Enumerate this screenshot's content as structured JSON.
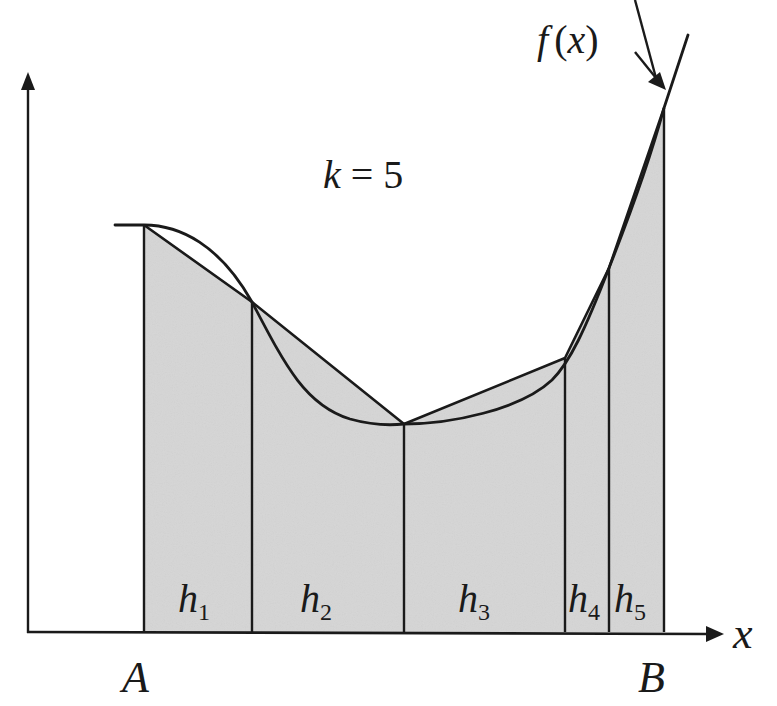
{
  "diagram": {
    "title_label": "k = 5",
    "k_var": "k",
    "k_eq": " = 5",
    "function_label": {
      "f": "f",
      "open": "(",
      "x": "x",
      "close": ")"
    },
    "x_axis_label": "x",
    "interval_start_label": "A",
    "interval_end_label": "B",
    "strips": [
      {
        "label": "h",
        "sub": "1"
      },
      {
        "label": "h",
        "sub": "2"
      },
      {
        "label": "h",
        "sub": "3"
      },
      {
        "label": "h",
        "sub": "4"
      },
      {
        "label": "h",
        "sub": "5"
      }
    ],
    "colors": {
      "fill": "#d6d6d6",
      "stroke": "#1a1a1a",
      "background": "#ffffff"
    }
  }
}
